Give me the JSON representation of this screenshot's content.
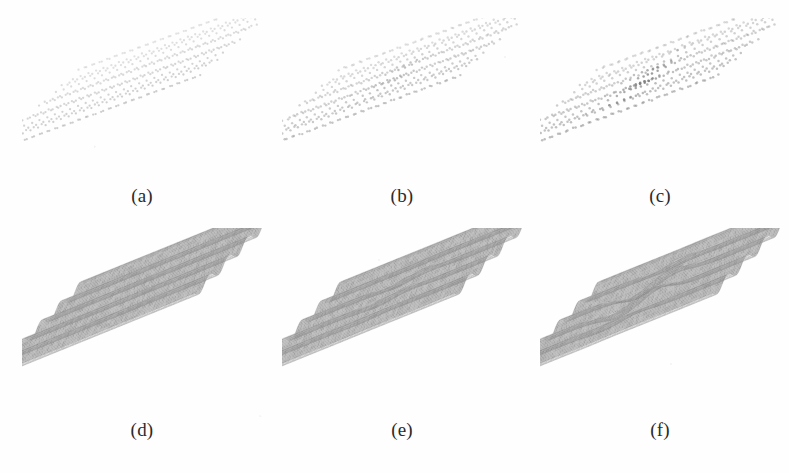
{
  "figure": {
    "width": 789,
    "height": 473,
    "background_color": "#fefefe",
    "kind": "multi-panel scientific figure",
    "rows": 2,
    "columns": 3,
    "row_descriptions": [
      "point-cloud / lattice site scatter renderings",
      "shaded 3D corrugated surface mesh renderings"
    ]
  },
  "palette": {
    "dot_color": "#b9b9b9",
    "dot_color_dark": "#8d8d8d",
    "surface_light": "#e6e6e6",
    "surface_mid": "#b4b4b4",
    "surface_dark": "#8f8f8f",
    "surface_edge": "#777777",
    "label_color": "#2b2b2b",
    "background": "#fefefe"
  },
  "panels": [
    {
      "id": "a",
      "label": "(a)",
      "row": 0,
      "column": 0,
      "type": "points",
      "state": "pristine",
      "defect": "none",
      "x": 22,
      "y": 18,
      "width": 240,
      "height": 165,
      "label_x": 22,
      "label_y": 186,
      "label_width": 240,
      "grid_rows": 17,
      "grid_cols": 27,
      "dot_radius": 1.15,
      "dot_opacity": 0.38,
      "jitter": 0.25,
      "defect_strength": 0.0,
      "defect_center_u": 0.5,
      "defect_center_v": 0.5
    },
    {
      "id": "b",
      "label": "(b)",
      "row": 0,
      "column": 1,
      "type": "points",
      "state": "weakly perturbed",
      "defect": "faint central perturbation",
      "x": 282,
      "y": 18,
      "width": 240,
      "height": 165,
      "label_x": 282,
      "label_y": 186,
      "label_width": 240,
      "grid_rows": 17,
      "grid_cols": 27,
      "dot_radius": 1.2,
      "dot_opacity": 0.44,
      "jitter": 0.45,
      "defect_strength": 0.35,
      "defect_center_u": 0.5,
      "defect_center_v": 0.52
    },
    {
      "id": "c",
      "label": "(c)",
      "row": 0,
      "column": 2,
      "type": "points",
      "state": "defected",
      "defect": "localized compressed dislocation core",
      "x": 540,
      "y": 18,
      "width": 240,
      "height": 165,
      "label_x": 540,
      "label_y": 186,
      "label_width": 240,
      "grid_rows": 17,
      "grid_cols": 27,
      "dot_radius": 1.25,
      "dot_opacity": 0.5,
      "jitter": 0.5,
      "defect_strength": 1.0,
      "defect_center_u": 0.46,
      "defect_center_v": 0.55
    },
    {
      "id": "d",
      "label": "(d)",
      "row": 1,
      "column": 0,
      "type": "surface",
      "state": "pristine",
      "defect": "none",
      "x": 22,
      "y": 228,
      "width": 240,
      "height": 182,
      "label_x": 22,
      "label_y": 420,
      "label_width": 240,
      "ridges": 10,
      "mesh_cols": 120,
      "mesh_rows": 60,
      "defect_strength": 0.0,
      "defect_center_u": 0.5,
      "defect_center_v": 0.5
    },
    {
      "id": "e",
      "label": "(e)",
      "row": 1,
      "column": 1,
      "type": "surface",
      "state": "weakly perturbed",
      "defect": "faint broad central dip",
      "x": 282,
      "y": 228,
      "width": 240,
      "height": 182,
      "label_x": 282,
      "label_y": 420,
      "label_width": 240,
      "ridges": 10,
      "mesh_cols": 120,
      "mesh_rows": 60,
      "defect_strength": 0.3,
      "defect_center_u": 0.5,
      "defect_center_v": 0.5
    },
    {
      "id": "f",
      "label": "(f)",
      "row": 1,
      "column": 2,
      "type": "surface",
      "state": "defected",
      "defect": "S-shaped dislocation kink in the corrugation",
      "x": 540,
      "y": 228,
      "width": 240,
      "height": 182,
      "label_x": 540,
      "label_y": 420,
      "label_width": 240,
      "ridges": 10,
      "mesh_cols": 120,
      "mesh_rows": 60,
      "defect_strength": 1.0,
      "defect_center_u": 0.44,
      "defect_center_v": 0.5
    }
  ],
  "geometry": {
    "projection": "oblique parallel projection",
    "tilt_dx": 0.62,
    "tilt_dy": -0.4,
    "note": "each panel shows the same rectangular patch seen from the same oblique viewpoint"
  },
  "chart_data": {
    "type": "scatter",
    "title": "",
    "xlabel": "",
    "ylabel": "",
    "panel_labels": [
      "(a)",
      "(b)",
      "(c)",
      "(d)",
      "(e)",
      "(f)"
    ],
    "series": [
      {
        "name": "(a) lattice sites - pristine",
        "defect_amplitude": 0.0
      },
      {
        "name": "(b) lattice sites - perturbed",
        "defect_amplitude": 0.35
      },
      {
        "name": "(c) lattice sites - defected",
        "defect_amplitude": 1.0
      },
      {
        "name": "(d) surface height - pristine",
        "defect_amplitude": 0.0
      },
      {
        "name": "(e) surface height - perturbed",
        "defect_amplitude": 0.3
      },
      {
        "name": "(f) surface height - defected",
        "defect_amplitude": 1.0
      }
    ]
  }
}
